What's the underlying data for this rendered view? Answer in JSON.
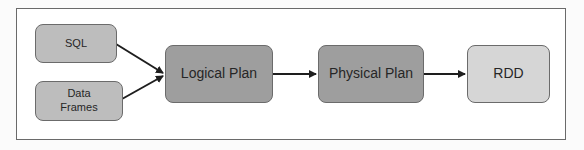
{
  "diagram": {
    "title": "",
    "nodes": [
      {
        "id": "sql",
        "label": "SQL"
      },
      {
        "id": "dataframes",
        "label_line1": "Data",
        "label_line2": "Frames"
      },
      {
        "id": "logical_plan",
        "label": "Logical Plan"
      },
      {
        "id": "physical_plan",
        "label": "Physical Plan"
      },
      {
        "id": "rdd",
        "label": "RDD"
      }
    ],
    "edges": [
      {
        "from": "sql",
        "to": "logical_plan"
      },
      {
        "from": "dataframes",
        "to": "logical_plan"
      },
      {
        "from": "logical_plan",
        "to": "physical_plan"
      },
      {
        "from": "physical_plan",
        "to": "rdd"
      }
    ],
    "colors": {
      "input_fill": "#bdbdbd",
      "plan_fill": "#9e9e9e",
      "output_fill": "#d6d6d6",
      "border": "#6b6b6b",
      "arrow": "#1e1e1e"
    }
  }
}
